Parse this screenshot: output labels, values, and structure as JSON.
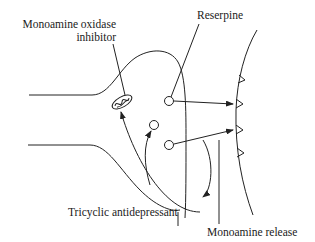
{
  "labels": {
    "mao_inhibitor_line1": "Monoamine oxidase",
    "mao_inhibitor_line2": "inhibitor",
    "reserpine": "Reserpine",
    "tricyclic": "Tricyclic antidepressant",
    "monoamine_release": "Monoamine release"
  },
  "colors": {
    "line": "#222222",
    "background": "#ffffff"
  }
}
